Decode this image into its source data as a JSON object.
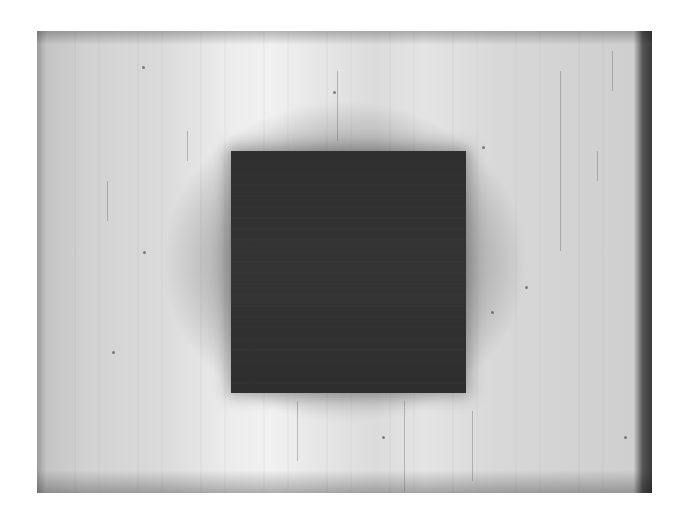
{
  "image": {
    "description": "Grayscale photograph of a dark square object centered on a light, scratched, unevenly lit background",
    "colors": {
      "page_background": "#ffffff",
      "background_light": "#ececec",
      "background_mid": "#d4d4d4",
      "edge_dark": "#3a3a3a",
      "square": "#303030"
    },
    "photo_bounds": {
      "x": 37,
      "y": 31,
      "width": 615,
      "height": 462
    },
    "square_bounds": {
      "x": 231,
      "y": 151,
      "width": 235,
      "height": 242
    }
  }
}
